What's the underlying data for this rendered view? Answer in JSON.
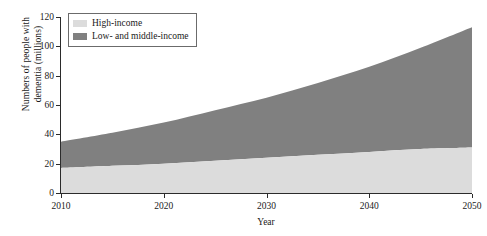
{
  "chart_data": {
    "type": "area",
    "title": "",
    "subtitle": "",
    "xlabel": "Year",
    "ylabel": "Numbers of people with dementia (millions)",
    "ylabel_line1": "Numbers of people with",
    "ylabel_line2": "dementia (millions)",
    "stacked": true,
    "grid": false,
    "legend_position": "top-left",
    "xlim": [
      2010,
      2050
    ],
    "ylim": [
      0,
      120
    ],
    "x": [
      2010,
      2015,
      2020,
      2025,
      2030,
      2035,
      2040,
      2045,
      2050
    ],
    "xticks": [
      2010,
      2020,
      2030,
      2040,
      2050
    ],
    "xticklabels": [
      "2010",
      "2020",
      "2030",
      "2040",
      "2050"
    ],
    "yticks": [
      0,
      20,
      40,
      60,
      80,
      100,
      120
    ],
    "yticklabels": [
      "0",
      "20",
      "40",
      "60",
      "80",
      "100",
      "120"
    ],
    "series": [
      {
        "name": "High-income",
        "color": "#dcdcdc",
        "values": [
          17,
          18.5,
          20,
          22,
          24,
          26,
          28,
          30,
          31
        ]
      },
      {
        "name": "Low- and middle-income",
        "color": "#808080",
        "values": [
          18,
          22.5,
          28,
          34.5,
          41,
          49,
          58,
          69,
          82
        ]
      }
    ],
    "totals": [
      35,
      41,
      48,
      56.5,
      65,
      75,
      86,
      99,
      113
    ],
    "colors": {
      "high_income": "#dcdcdc",
      "low_and_middle_income": "#808080",
      "axis": "#2b2b2b",
      "legend_border": "#6b6b6b",
      "background": "#ffffff"
    }
  },
  "legend": {
    "items": [
      {
        "label": "High-income",
        "color": "#dcdcdc"
      },
      {
        "label": "Low- and middle-income",
        "color": "#808080"
      }
    ]
  }
}
